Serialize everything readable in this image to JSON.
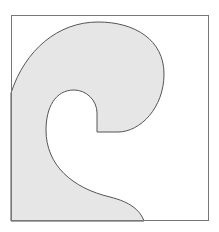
{
  "diagram": {
    "frame": {
      "x": 11,
      "y": 15,
      "width": 198,
      "height": 206,
      "stroke": "#777777"
    },
    "shape": {
      "fill": "#e6e6e6",
      "stroke": "#555555",
      "description": "curled wave / hook shape"
    }
  }
}
